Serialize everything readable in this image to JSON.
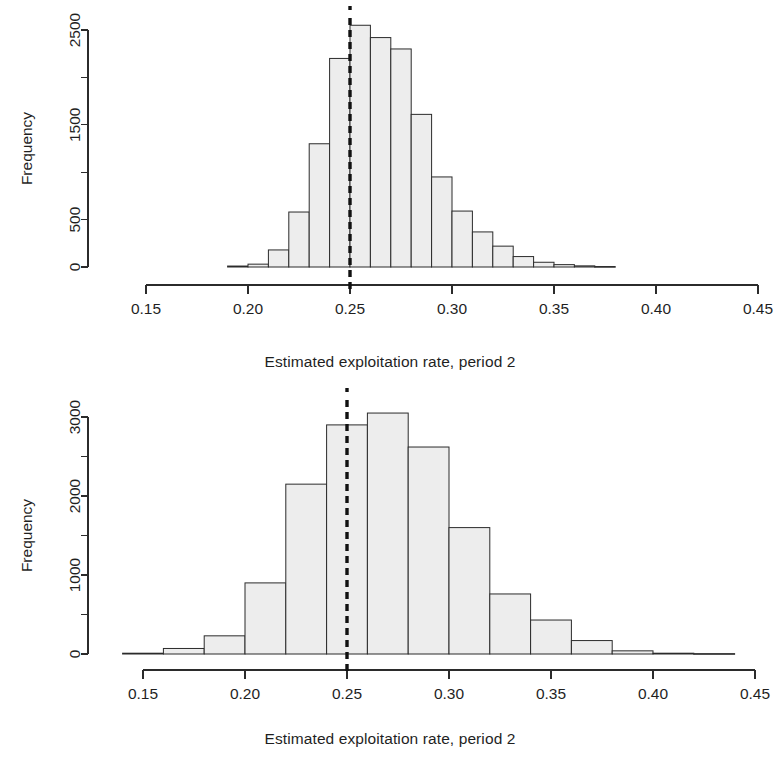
{
  "figure": {
    "kind": "two-panel-histogram-figure",
    "background": "#ffffff",
    "bar_fill": "#ededed",
    "bar_stroke": "#2b2b2b",
    "reference_line_color": "#111111"
  },
  "panels": [
    {
      "id": "top",
      "xlabel": "Estimated exploitation rate, period 2",
      "ylabel": "Frequency",
      "xticks": [
        "0.15",
        "0.20",
        "0.25",
        "0.30",
        "0.35",
        "0.40",
        "0.45"
      ],
      "yticks": [
        "0",
        "500",
        "1500",
        "2500"
      ]
    },
    {
      "id": "bottom",
      "xlabel": "Estimated exploitation rate, period 2",
      "ylabel": "Frequency",
      "xticks": [
        "0.15",
        "0.20",
        "0.25",
        "0.30",
        "0.35",
        "0.40",
        "0.45"
      ],
      "yticks": [
        "0",
        "1000",
        "2000",
        "3000"
      ]
    }
  ],
  "chart_data": [
    {
      "type": "bar",
      "subtype": "histogram",
      "panel": "top",
      "title": "",
      "xlabel": "Estimated exploitation rate, period 2",
      "ylabel": "Frequency",
      "xlim": [
        0.15,
        0.45
      ],
      "ylim": [
        0,
        2600
      ],
      "grid": false,
      "legend": null,
      "xtick_values": [
        0.15,
        0.2,
        0.25,
        0.3,
        0.35,
        0.4,
        0.45
      ],
      "xtick_labels": [
        "0.15",
        "0.20",
        "0.25",
        "0.30",
        "0.35",
        "0.40",
        "0.45"
      ],
      "ytick_values": [
        0,
        500,
        1500,
        2500
      ],
      "ytick_labels": [
        "0",
        "500",
        "1500",
        "2500"
      ],
      "yminor_tick_values": [
        1000,
        2000
      ],
      "bin_width": 0.01,
      "bin_edges": [
        0.19,
        0.2,
        0.21,
        0.22,
        0.23,
        0.24,
        0.25,
        0.26,
        0.27,
        0.28,
        0.29,
        0.3,
        0.31,
        0.32,
        0.33,
        0.34,
        0.35,
        0.36,
        0.37,
        0.38
      ],
      "bin_centers": [
        0.195,
        0.205,
        0.215,
        0.225,
        0.235,
        0.245,
        0.255,
        0.265,
        0.275,
        0.285,
        0.295,
        0.305,
        0.315,
        0.325,
        0.335,
        0.345,
        0.355,
        0.365,
        0.375
      ],
      "values": [
        10,
        30,
        180,
        580,
        1300,
        2200,
        2550,
        2420,
        2300,
        1610,
        950,
        590,
        370,
        220,
        110,
        50,
        25,
        12,
        5
      ],
      "annotations": [
        {
          "name": "true-value-reference-line",
          "style": "dashed-vertical",
          "x": 0.25,
          "color": "#111111"
        }
      ]
    },
    {
      "type": "bar",
      "subtype": "histogram",
      "panel": "bottom",
      "title": "",
      "xlabel": "Estimated exploitation rate, period 2",
      "ylabel": "Frequency",
      "xlim": [
        0.13,
        0.45
      ],
      "ylim": [
        0,
        3150
      ],
      "grid": false,
      "legend": null,
      "xtick_values": [
        0.15,
        0.2,
        0.25,
        0.3,
        0.35,
        0.4,
        0.45
      ],
      "xtick_labels": [
        "0.15",
        "0.20",
        "0.25",
        "0.30",
        "0.35",
        "0.40",
        "0.45"
      ],
      "ytick_values": [
        0,
        1000,
        2000,
        3000
      ],
      "ytick_labels": [
        "0",
        "1000",
        "2000",
        "3000"
      ],
      "yminor_tick_values": [
        500,
        1500,
        2500
      ],
      "bin_width": 0.02,
      "bin_edges": [
        0.14,
        0.16,
        0.18,
        0.2,
        0.22,
        0.24,
        0.26,
        0.28,
        0.3,
        0.32,
        0.34,
        0.36,
        0.38,
        0.4,
        0.42,
        0.44
      ],
      "bin_centers": [
        0.15,
        0.17,
        0.19,
        0.21,
        0.23,
        0.25,
        0.27,
        0.29,
        0.31,
        0.33,
        0.35,
        0.37,
        0.39,
        0.41,
        0.43
      ],
      "values": [
        10,
        70,
        230,
        900,
        2150,
        2900,
        3050,
        2620,
        1600,
        760,
        430,
        170,
        40,
        10,
        5
      ],
      "annotations": [
        {
          "name": "true-value-reference-line",
          "style": "dashed-vertical",
          "x": 0.25,
          "color": "#111111"
        }
      ]
    }
  ]
}
